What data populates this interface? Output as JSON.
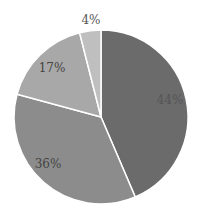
{
  "chart_data": {
    "type": "pie",
    "title": "",
    "start_angle_deg": 0,
    "direction": "clockwise",
    "center": [
      101,
      117
    ],
    "radius": 87,
    "slices": [
      {
        "label": "44%",
        "value": 44,
        "color": "#6b6b6b",
        "label_pos": [
          170,
          100
        ],
        "label_color": "#555555"
      },
      {
        "label": "36%",
        "value": 36,
        "color": "#8c8c8c",
        "label_pos": [
          48,
          164
        ],
        "label_color": "#444444"
      },
      {
        "label": "17%",
        "value": 17,
        "color": "#a8a8a8",
        "label_pos": [
          52,
          68
        ],
        "label_color": "#444444"
      },
      {
        "label": "4%",
        "value": 4,
        "color": "#bfbfbf",
        "label_pos": [
          91,
          20
        ],
        "label_color": "#555555"
      }
    ],
    "separator_color": "#ffffff",
    "legend": null
  }
}
